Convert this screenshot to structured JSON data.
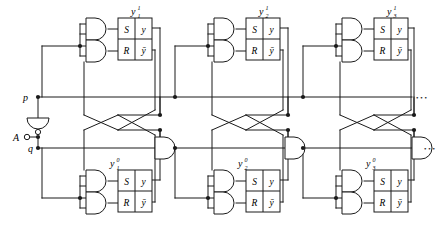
{
  "diagram": {
    "type": "logic-circuit-schematic",
    "line_color": "#1a1a1a",
    "background": "#ffffff"
  },
  "inputs": {
    "p_label": "p",
    "q_label": "q",
    "a_label": "A"
  },
  "latch_box": {
    "s_label": "S",
    "y_label": "y",
    "r_label": "R",
    "ybar_label": "ȳ"
  },
  "stages": [
    {
      "index": 1,
      "top_output_label": "y",
      "top_output_sub": "1",
      "top_output_sup": "1",
      "bottom_output_label": "y",
      "bottom_output_sub": "1",
      "bottom_output_sup": "0"
    },
    {
      "index": 2,
      "top_output_label": "y",
      "top_output_sub": "2",
      "top_output_sup": "1",
      "bottom_output_label": "y",
      "bottom_output_sub": "2",
      "bottom_output_sup": "0"
    },
    {
      "index": 3,
      "top_output_label": "y",
      "top_output_sub": "3",
      "top_output_sup": "1",
      "bottom_output_label": "y",
      "bottom_output_sub": "3",
      "bottom_output_sup": "0"
    }
  ],
  "continuation": {
    "p_line_dots": "• • •",
    "q_line_dots": "• • •"
  },
  "components": {
    "and_gate": "and-gate",
    "inverter": "inverter-gate",
    "sr_latch": "sr-latch-box",
    "junction": "wire-junction-dot",
    "terminal": "input-terminal-circle"
  }
}
